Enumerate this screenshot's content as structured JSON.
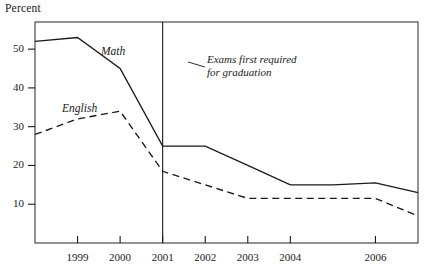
{
  "chart_data": {
    "type": "line",
    "title": "",
    "ylabel": "Percent",
    "xlabel": "",
    "x": [
      1998,
      1999,
      2000,
      2001,
      2002,
      2003,
      2004,
      2005,
      2006,
      2007
    ],
    "xticks": [
      1999,
      2000,
      2001,
      2002,
      2003,
      2004,
      2006
    ],
    "xtick_labels": [
      "1999",
      "2000",
      "2001",
      "2002",
      "2003",
      "2004",
      "2006"
    ],
    "yticks": [
      10,
      20,
      30,
      40,
      50
    ],
    "ytick_labels": [
      "10",
      "20",
      "30",
      "40",
      "50"
    ],
    "ylim": [
      0,
      57
    ],
    "xlim": [
      1998,
      2007
    ],
    "grid": false,
    "legend_position": "inline-labels",
    "series": [
      {
        "name": "Math",
        "style": "solid",
        "color": "#1a1a1a",
        "label_text": "Math",
        "values": [
          52,
          53,
          45,
          25,
          25,
          20,
          15,
          15,
          15.5,
          13
        ]
      },
      {
        "name": "English",
        "style": "dashed",
        "color": "#1a1a1a",
        "label_text": "English",
        "values": [
          28,
          32,
          34,
          18.5,
          15,
          11.5,
          11.5,
          11.5,
          11.5,
          7
        ]
      }
    ],
    "annotations": [
      {
        "name": "exams-required-note",
        "line1": "Exams first required",
        "line2": "for graduation",
        "marker_x": 2001,
        "marker_type": "vertical-rule"
      }
    ]
  }
}
